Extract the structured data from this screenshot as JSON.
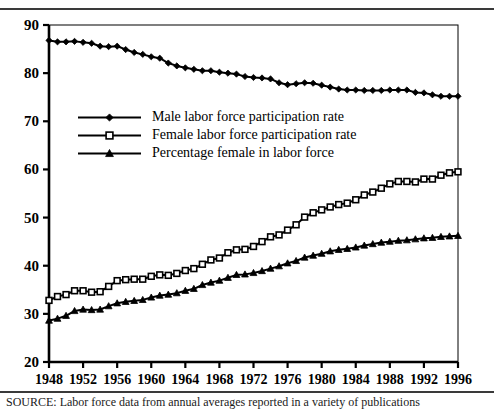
{
  "figure": {
    "background_color": "#ffffff",
    "rule_color": "#3a3a3a",
    "caption": "SOURCE: Labor force data from annual averages reported in a variety of publications"
  },
  "chart_data": {
    "type": "line",
    "title": "",
    "subtitle": "",
    "xlabel": "",
    "ylabel": "",
    "xlim": [
      1948,
      1996
    ],
    "ylim": [
      20,
      90
    ],
    "grid": false,
    "legend_position": "upper-left-inside",
    "x_ticks": [
      1948,
      1952,
      1956,
      1960,
      1964,
      1968,
      1972,
      1976,
      1980,
      1984,
      1988,
      1992,
      1996
    ],
    "y_ticks": [
      20,
      30,
      40,
      50,
      60,
      70,
      80,
      90
    ],
    "x": [
      1948,
      1949,
      1950,
      1951,
      1952,
      1953,
      1954,
      1955,
      1956,
      1957,
      1958,
      1959,
      1960,
      1961,
      1962,
      1963,
      1964,
      1965,
      1966,
      1967,
      1968,
      1969,
      1970,
      1971,
      1972,
      1973,
      1974,
      1975,
      1976,
      1977,
      1978,
      1979,
      1980,
      1981,
      1982,
      1983,
      1984,
      1985,
      1986,
      1987,
      1988,
      1989,
      1990,
      1991,
      1992,
      1993,
      1994,
      1995,
      1996
    ],
    "series": [
      {
        "name": "Male labor force participation rate",
        "marker": "filled-diamond",
        "color": "#000000",
        "values": [
          86.8,
          86.5,
          86.5,
          86.6,
          86.4,
          86.2,
          85.6,
          85.5,
          85.6,
          84.9,
          84.3,
          83.9,
          83.4,
          83.1,
          82.1,
          81.5,
          81.1,
          80.8,
          80.5,
          80.5,
          80.2,
          80.0,
          79.8,
          79.3,
          79.1,
          79.0,
          78.8,
          78.0,
          77.6,
          77.8,
          78.0,
          77.9,
          77.5,
          77.1,
          76.7,
          76.5,
          76.5,
          76.4,
          76.4,
          76.4,
          76.5,
          76.5,
          76.5,
          76.0,
          75.9,
          75.5,
          75.2,
          75.2,
          75.2
        ]
      },
      {
        "name": "Female labor force participation rate",
        "marker": "open-square",
        "color": "#000000",
        "values": [
          32.8,
          33.6,
          34.0,
          34.8,
          34.8,
          34.5,
          34.6,
          35.7,
          36.9,
          37.1,
          37.2,
          37.2,
          37.8,
          38.1,
          38.0,
          38.4,
          39.0,
          39.4,
          40.3,
          41.2,
          41.6,
          42.7,
          43.3,
          43.4,
          44.0,
          45.0,
          46.0,
          46.4,
          47.4,
          48.5,
          50.1,
          51.0,
          51.6,
          52.2,
          52.7,
          53.0,
          53.7,
          54.7,
          55.3,
          56.1,
          57.0,
          57.5,
          57.5,
          57.4,
          58.0,
          58.0,
          58.8,
          59.3,
          59.5
        ]
      },
      {
        "name": "Percentage female in labor force",
        "marker": "filled-triangle",
        "color": "#000000",
        "values": [
          28.6,
          29.0,
          29.6,
          30.6,
          30.9,
          30.8,
          30.9,
          31.6,
          32.2,
          32.5,
          32.7,
          32.9,
          33.4,
          33.8,
          34.0,
          34.3,
          34.8,
          35.2,
          36.0,
          36.5,
          36.9,
          37.5,
          38.1,
          38.2,
          38.5,
          38.9,
          39.4,
          39.9,
          40.5,
          41.0,
          41.7,
          42.1,
          42.5,
          43.0,
          43.3,
          43.5,
          43.8,
          44.2,
          44.5,
          44.8,
          45.0,
          45.2,
          45.3,
          45.5,
          45.7,
          45.8,
          46.0,
          46.1,
          46.2
        ]
      }
    ],
    "legend_entries": [
      "Male labor force participation rate",
      "Female labor force participation rate",
      "Percentage female in labor force"
    ]
  }
}
